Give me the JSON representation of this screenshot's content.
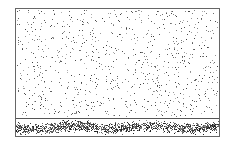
{
  "figure": {
    "colors": {
      "border": "#666666",
      "dots": "#333333",
      "background": "#ffffff"
    },
    "upper_panel": {
      "dot_count": 900,
      "dot_color": "#444444"
    },
    "lower_band": {
      "dot_count": 1400,
      "dot_color": "#222222"
    }
  }
}
